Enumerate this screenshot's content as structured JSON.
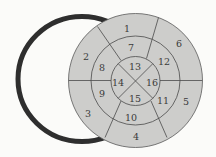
{
  "diagram": {
    "type": "bullseye-16-segment",
    "colors": {
      "background": "#fbfbf9",
      "segment_fill": "#cdcdcb",
      "segment_stroke": "#4a4a4a",
      "ring_stroke": "#2e2e2e"
    },
    "rings": {
      "outer": [
        "1",
        "2",
        "3",
        "4",
        "5",
        "6"
      ],
      "middle": [
        "7",
        "8",
        "9",
        "10",
        "11",
        "12"
      ],
      "inner": [
        "13",
        "14",
        "15",
        "16"
      ]
    },
    "segments": [
      {
        "label": "1",
        "x": 127,
        "y": 28
      },
      {
        "label": "2",
        "x": 86,
        "y": 56
      },
      {
        "label": "3",
        "x": 88,
        "y": 113
      },
      {
        "label": "4",
        "x": 136,
        "y": 136
      },
      {
        "label": "5",
        "x": 186,
        "y": 101
      },
      {
        "label": "6",
        "x": 179,
        "y": 43
      },
      {
        "label": "7",
        "x": 131,
        "y": 47
      },
      {
        "label": "8",
        "x": 102,
        "y": 67
      },
      {
        "label": "9",
        "x": 102,
        "y": 93
      },
      {
        "label": "10",
        "x": 131,
        "y": 117
      },
      {
        "label": "11",
        "x": 163,
        "y": 100
      },
      {
        "label": "12",
        "x": 164,
        "y": 61
      },
      {
        "label": "13",
        "x": 135,
        "y": 66
      },
      {
        "label": "14",
        "x": 118,
        "y": 82
      },
      {
        "label": "15",
        "x": 135,
        "y": 98
      },
      {
        "label": "16",
        "x": 152,
        "y": 82
      }
    ]
  }
}
